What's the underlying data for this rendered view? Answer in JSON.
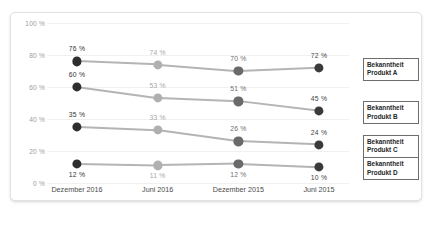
{
  "chart_data": {
    "type": "line",
    "title": "",
    "xlabel": "",
    "ylabel": "",
    "ylim": [
      0,
      100
    ],
    "grid": true,
    "legend_position": "right",
    "categories": [
      "Dezember 2016",
      "Juni 2016",
      "Dezember 2015",
      "Juni 2015"
    ],
    "y_ticks": [
      "0 %",
      "20 %",
      "40 %",
      "60 %",
      "80 %",
      "100 %"
    ],
    "y_tick_values": [
      0,
      20,
      40,
      60,
      80,
      100
    ],
    "series": [
      {
        "name": "Bekanntheit Produkt A",
        "values": [
          76,
          74,
          70,
          72
        ],
        "labels": [
          "76 %",
          "74 %",
          "70 %",
          "72 %"
        ],
        "label_position": "above"
      },
      {
        "name": "Bekanntheit Produkt B",
        "values": [
          60,
          53,
          51,
          45
        ],
        "labels": [
          "60 %",
          "53 %",
          "51 %",
          "45 %"
        ],
        "label_position": "above"
      },
      {
        "name": "Bekanntheit Produkt C",
        "values": [
          35,
          33,
          26,
          24
        ],
        "labels": [
          "35 %",
          "33 %",
          "26 %",
          "24 %"
        ],
        "label_position": "above"
      },
      {
        "name": "Bekanntheit Produkt D",
        "values": [
          12,
          11,
          12,
          10
        ],
        "labels": [
          "12 %",
          "11 %",
          "12 %",
          "10 %"
        ],
        "label_position": "below"
      }
    ],
    "point_colors": [
      "#2e2e2e",
      "#b0b0b0",
      "#6a6a6a",
      "#3a3a3a"
    ],
    "label_colors": [
      "#333333",
      "#a8a8a8",
      "#6f6f6f",
      "#3f3f3f"
    ],
    "line_color": "#b4b4b4",
    "grid_color": "#f0f0f0"
  },
  "legend": {
    "items": [
      {
        "line1": "Bekanntheit",
        "line2": "Produkt A"
      },
      {
        "line1": "Bekanntheit",
        "line2": "Produkt B"
      },
      {
        "line1": "Bekanntheit",
        "line2": "Produkt C"
      },
      {
        "line1": "Bekanntheit",
        "line2": "Produkt D"
      }
    ]
  }
}
